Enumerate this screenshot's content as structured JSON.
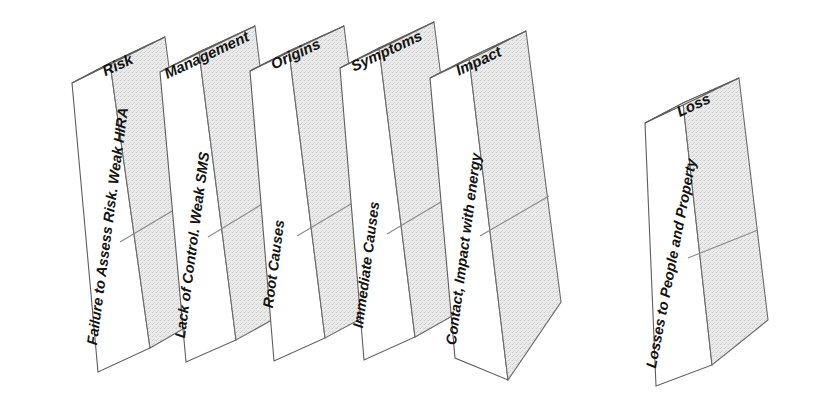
{
  "diagram": {
    "type": "domino-sequence",
    "orientation": "left-to-right falling dominoes",
    "colors": {
      "outline": "#5d5d5d",
      "front_face": "#ffffff",
      "side_face": "#e8e8e8",
      "text": "#131313",
      "background": "#ffffff"
    },
    "dominoes": [
      {
        "index": 1,
        "top_label": "Risk",
        "front_label": "Failure to Assess Risk. Weak HIRA"
      },
      {
        "index": 2,
        "top_label": "Management",
        "front_label": "Lack of Control. Weak SMS"
      },
      {
        "index": 3,
        "top_label": "Origins",
        "front_label": "Root Causes"
      },
      {
        "index": 4,
        "top_label": "Symptoms",
        "front_label": "Immediate Causes"
      },
      {
        "index": 5,
        "top_label": "Impact",
        "front_label": "Contact, Impact with energy"
      },
      {
        "index": 6,
        "top_label": "Loss",
        "front_label": "Losses to People and Property"
      }
    ]
  }
}
